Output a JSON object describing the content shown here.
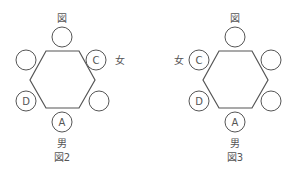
{
  "colors": {
    "stroke": "#555555",
    "text": "#555555",
    "background": "#ffffff"
  },
  "figures": [
    {
      "caption": "図2",
      "top_label": "図",
      "bottom_label": "男",
      "side_label": "女",
      "seats": {
        "top": "",
        "upper_left": "",
        "upper_right": "C",
        "lower_left": "D",
        "lower_right": "",
        "bottom": "A"
      }
    },
    {
      "caption": "図3",
      "top_label": "図",
      "bottom_label": "男",
      "side_label": "女",
      "seats": {
        "top": "",
        "upper_left": "C",
        "upper_right": "",
        "lower_left": "D",
        "lower_right": "",
        "bottom": "A"
      }
    }
  ]
}
